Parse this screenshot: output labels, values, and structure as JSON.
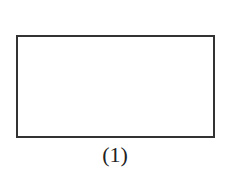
{
  "figure": {
    "shape": "rectangle",
    "caption": "(1)",
    "stroke_color": "#333333"
  }
}
